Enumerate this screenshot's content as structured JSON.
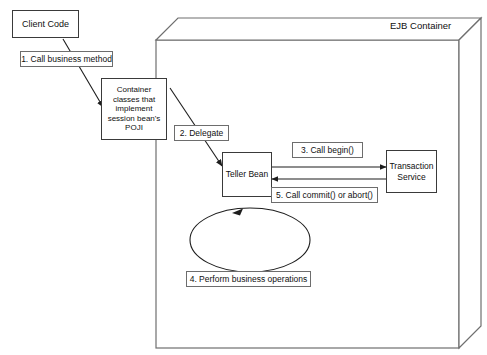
{
  "diagram": {
    "title": "EJB Container",
    "background_color": "#ffffff",
    "line_color": "#3a3a3a",
    "text_color": "#101010",
    "nodes": {
      "client_code": "Client Code",
      "container_classes": "Container\nclasses that\nimplement\nsession bean's\nPOJI",
      "teller_bean": "Teller Bean",
      "transaction_service": "Transaction\nService"
    },
    "steps": [
      {
        "id": "step-1",
        "label": "1. Call business method"
      },
      {
        "id": "step-2",
        "label": "2. Delegate"
      },
      {
        "id": "step-3",
        "label": "3. Call begin()"
      },
      {
        "id": "step-4",
        "label": "4. Perform business operations"
      },
      {
        "id": "step-5",
        "label": "5. Call commit() or abort()"
      }
    ]
  }
}
